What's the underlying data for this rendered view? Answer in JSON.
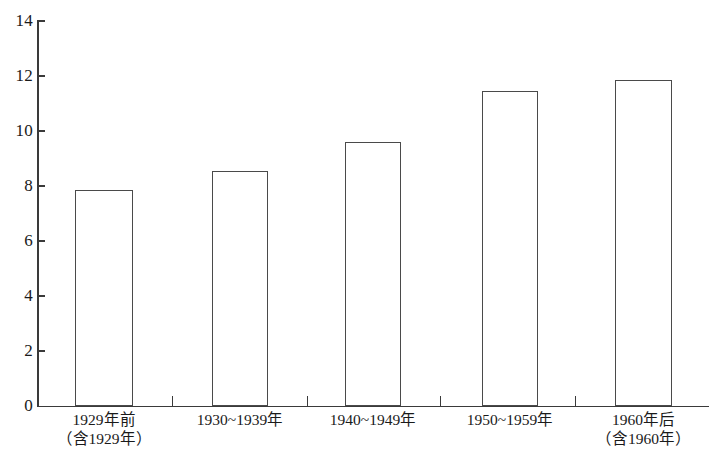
{
  "chart_data": {
    "type": "bar",
    "title": "",
    "subtitle": "",
    "xlabel": "",
    "ylabel": "",
    "ylim": [
      0,
      14
    ],
    "ytick_values": [
      0,
      2,
      4,
      6,
      8,
      10,
      12,
      14
    ],
    "ytick_labels": [
      "0",
      "2",
      "4",
      "6",
      "8",
      "10",
      "12",
      "14"
    ],
    "grid": false,
    "legend": false,
    "legend_position": "none",
    "categories": [
      "1929年前（含1929年）",
      "1930~1939年",
      "1940~1949年",
      "1950~1959年",
      "1960年后（含1960年）"
    ],
    "category_labels": [
      {
        "line1": "1929年前",
        "line2": "（含1929年）"
      },
      {
        "line1": "1930~1939年",
        "line2": ""
      },
      {
        "line1": "1940~1949年",
        "line2": ""
      },
      {
        "line1": "1950~1959年",
        "line2": ""
      },
      {
        "line1": "1960年后",
        "line2": "（含1960年）"
      }
    ],
    "values": [
      7.85,
      8.55,
      9.6,
      11.45,
      11.85
    ],
    "bar_face_color": "#ffffff",
    "bar_edge_color": "#4a4a4a",
    "axis_color": "#3a3a3a",
    "background_color": "#ffffff"
  }
}
